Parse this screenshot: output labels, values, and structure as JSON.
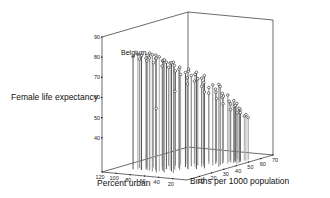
{
  "chart_data": {
    "type": "scatter",
    "subtype": "3d-scatter-with-drop-lines",
    "title": "",
    "zlabel": "Female life expectancy",
    "xlabel": "Percent urban",
    "ylabel": "Births per 1000 population",
    "zticks": [
      40,
      50,
      60,
      70,
      80,
      90
    ],
    "xticks": [
      120,
      100,
      80,
      60,
      40,
      20
    ],
    "yticks": [
      10,
      20,
      30,
      40,
      50,
      60,
      70
    ],
    "zlim": [
      23,
      90
    ],
    "xlim": [
      0,
      120
    ],
    "ylim": [
      0,
      70
    ],
    "annotations": [
      {
        "text": "Belgium",
        "urban": 97,
        "births": 12,
        "life": 79
      }
    ],
    "grid": false,
    "legend": null,
    "points": [
      {
        "urban": 97,
        "births": 12,
        "life": 79
      },
      {
        "urban": 92,
        "births": 13,
        "life": 80
      },
      {
        "urban": 89,
        "births": 14,
        "life": 79
      },
      {
        "urban": 85,
        "births": 12,
        "life": 80
      },
      {
        "urban": 84,
        "births": 15,
        "life": 78
      },
      {
        "urban": 79,
        "births": 13,
        "life": 80
      },
      {
        "urban": 77,
        "births": 14,
        "life": 81
      },
      {
        "urban": 74,
        "births": 12,
        "life": 79
      },
      {
        "urban": 72,
        "births": 16,
        "life": 78
      },
      {
        "urban": 70,
        "births": 15,
        "life": 80
      },
      {
        "urban": 68,
        "births": 11,
        "life": 81
      },
      {
        "urban": 66,
        "births": 13,
        "life": 79
      },
      {
        "urban": 64,
        "births": 17,
        "life": 77
      },
      {
        "urban": 62,
        "births": 19,
        "life": 76
      },
      {
        "urban": 60,
        "births": 12,
        "life": 80
      },
      {
        "urban": 58,
        "births": 14,
        "life": 78
      },
      {
        "urban": 56,
        "births": 22,
        "life": 74
      },
      {
        "urban": 55,
        "births": 18,
        "life": 76
      },
      {
        "urban": 53,
        "births": 24,
        "life": 72
      },
      {
        "urban": 51,
        "births": 11,
        "life": 79
      },
      {
        "urban": 49,
        "births": 27,
        "life": 70
      },
      {
        "urban": 48,
        "births": 15,
        "life": 77
      },
      {
        "urban": 46,
        "births": 30,
        "life": 68
      },
      {
        "urban": 45,
        "births": 20,
        "life": 74
      },
      {
        "urban": 43,
        "births": 26,
        "life": 71
      },
      {
        "urban": 42,
        "births": 33,
        "life": 66
      },
      {
        "urban": 40,
        "births": 12,
        "life": 78
      },
      {
        "urban": 39,
        "births": 29,
        "life": 69
      },
      {
        "urban": 37,
        "births": 35,
        "life": 64
      },
      {
        "urban": 36,
        "births": 22,
        "life": 73
      },
      {
        "urban": 35,
        "births": 38,
        "life": 61
      },
      {
        "urban": 33,
        "births": 31,
        "life": 67
      },
      {
        "urban": 32,
        "births": 42,
        "life": 58
      },
      {
        "urban": 30,
        "births": 25,
        "life": 71
      },
      {
        "urban": 29,
        "births": 40,
        "life": 60
      },
      {
        "urban": 28,
        "births": 45,
        "life": 55
      },
      {
        "urban": 26,
        "births": 36,
        "life": 63
      },
      {
        "urban": 25,
        "births": 44,
        "life": 56
      },
      {
        "urban": 24,
        "births": 28,
        "life": 69
      },
      {
        "urban": 22,
        "births": 47,
        "life": 53
      },
      {
        "urban": 21,
        "births": 41,
        "life": 58
      },
      {
        "urban": 20,
        "births": 50,
        "life": 50
      },
      {
        "urban": 19,
        "births": 38,
        "life": 62
      },
      {
        "urban": 18,
        "births": 46,
        "life": 52
      },
      {
        "urban": 17,
        "births": 43,
        "life": 57
      },
      {
        "urban": 16,
        "births": 52,
        "life": 48
      },
      {
        "urban": 15,
        "births": 48,
        "life": 51
      },
      {
        "urban": 14,
        "births": 34,
        "life": 64
      },
      {
        "urban": 13,
        "births": 51,
        "life": 47
      },
      {
        "urban": 12,
        "births": 45,
        "life": 54
      },
      {
        "urban": 11,
        "births": 53,
        "life": 45
      },
      {
        "urban": 10,
        "births": 49,
        "life": 49
      },
      {
        "urban": 9,
        "births": 55,
        "life": 44
      },
      {
        "urban": 8,
        "births": 47,
        "life": 50
      },
      {
        "urban": 7,
        "births": 52,
        "life": 46
      },
      {
        "urban": 6,
        "births": 44,
        "life": 53
      },
      {
        "urban": 95,
        "births": 16,
        "life": 77
      },
      {
        "urban": 88,
        "births": 18,
        "life": 76
      },
      {
        "urban": 82,
        "births": 20,
        "life": 75
      },
      {
        "urban": 75,
        "births": 23,
        "life": 73
      },
      {
        "urban": 71,
        "births": 26,
        "life": 72
      },
      {
        "urban": 65,
        "births": 28,
        "life": 70
      },
      {
        "urban": 61,
        "births": 30,
        "life": 68
      },
      {
        "urban": 57,
        "births": 33,
        "life": 66
      },
      {
        "urban": 52,
        "births": 36,
        "life": 64
      },
      {
        "urban": 47,
        "births": 39,
        "life": 61
      },
      {
        "urban": 44,
        "births": 43,
        "life": 57
      },
      {
        "urban": 38,
        "births": 46,
        "life": 54
      },
      {
        "urban": 34,
        "births": 49,
        "life": 51
      },
      {
        "urban": 27,
        "births": 51,
        "life": 48
      },
      {
        "urban": 23,
        "births": 54,
        "life": 46
      },
      {
        "urban": 59,
        "births": 9,
        "life": 55
      },
      {
        "urban": 50,
        "births": 19,
        "life": 62
      },
      {
        "urban": 41,
        "births": 24,
        "life": 65
      },
      {
        "urban": 31,
        "births": 32,
        "life": 60
      }
    ]
  },
  "labels": {
    "zlabel": "Female life expectancy",
    "xlabel": "Percent urban",
    "ylabel": "Births per 1000 population"
  }
}
